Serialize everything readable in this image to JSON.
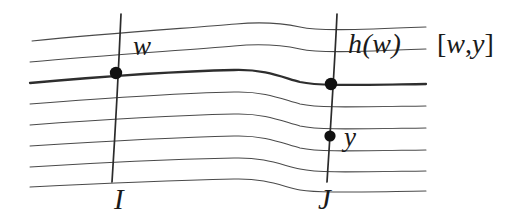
{
  "figure": {
    "kind": "mathematical-diagram",
    "background_color": "#ffffff",
    "ink_color": "#3a3a3a",
    "emphasis_color": "#2b2b2b",
    "dot_color": "#111111",
    "labels": {
      "w": "w",
      "h_of_w": "h(w)",
      "interval_open": "[",
      "interval_first": "w",
      "interval_comma": ",",
      "interval_second": "y",
      "interval_close": "]",
      "y": "y",
      "I": "I",
      "J": "J"
    },
    "points": [
      {
        "name": "w",
        "x": 116,
        "y": 73
      },
      {
        "name": "h(w)",
        "x": 331,
        "y": 84
      },
      {
        "name": "y",
        "x": 330,
        "y": 136
      }
    ],
    "transversals": [
      {
        "name": "I",
        "x_top": 121,
        "y_top": 14,
        "x_bottom": 112,
        "y_bottom": 182
      },
      {
        "name": "J",
        "x_top": 337,
        "y_top": 14,
        "x_bottom": 327,
        "y_bottom": 182
      }
    ],
    "leaves": {
      "count": 8,
      "left_x": 30,
      "right_x": 426,
      "left_y": [
        40,
        61,
        82,
        103,
        124,
        145,
        166,
        186
      ],
      "right_y": [
        27,
        49,
        84,
        106,
        128,
        150,
        171,
        191
      ],
      "emphasized_index": 2
    }
  }
}
